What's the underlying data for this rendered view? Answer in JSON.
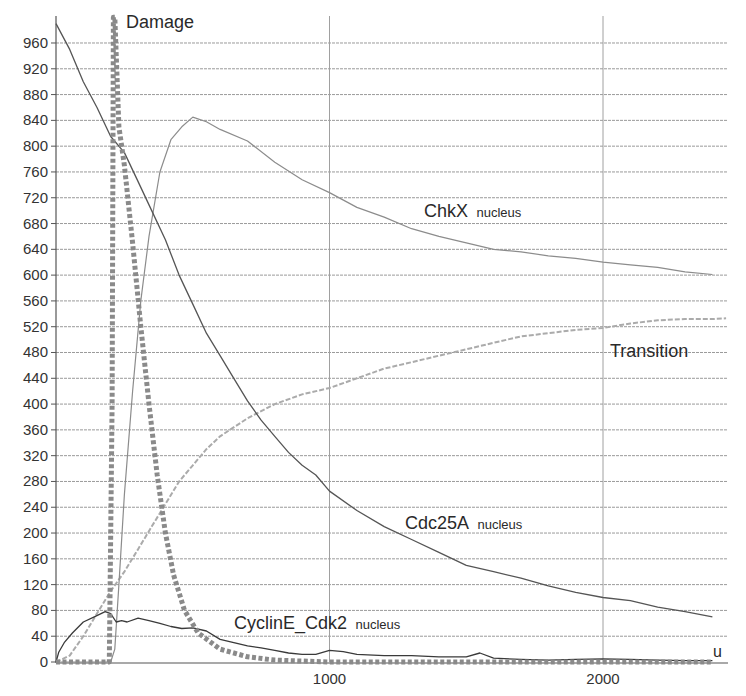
{
  "chart_data": {
    "type": "line",
    "title": "",
    "xlabel": "u",
    "ylabel": "",
    "xlim": [
      0,
      2450
    ],
    "ylim": [
      0,
      1000
    ],
    "grid": {
      "horizontal": true,
      "vertical": true
    },
    "x_ticks": [
      1000,
      2000
    ],
    "x_tick_labels": [
      "1000",
      "2000"
    ],
    "y_ticks": [
      0,
      40,
      80,
      120,
      160,
      200,
      240,
      280,
      320,
      360,
      400,
      440,
      480,
      520,
      560,
      600,
      640,
      680,
      720,
      760,
      800,
      840,
      880,
      920,
      960
    ],
    "y_tick_labels": [
      "0",
      "40",
      "80",
      "120",
      "160",
      "200",
      "240",
      "280",
      "320",
      "360",
      "400",
      "440",
      "480",
      "520",
      "560",
      "600",
      "640",
      "680",
      "720",
      "760",
      "800",
      "840",
      "880",
      "920",
      "960"
    ],
    "legend": "inline labels",
    "series": [
      {
        "name": "Damage",
        "style": "thick dotted",
        "color": "#8c8c8c",
        "x": [
          0,
          100,
          195,
          205,
          210,
          215,
          230,
          250,
          280,
          310,
          340,
          370,
          400,
          430,
          470,
          520,
          600,
          700,
          800,
          1000,
          1500,
          2000,
          2400
        ],
        "values": [
          0,
          0,
          0,
          400,
          1000,
          1000,
          830,
          770,
          650,
          520,
          400,
          290,
          200,
          135,
          80,
          45,
          20,
          8,
          3,
          0,
          0,
          0,
          0
        ]
      },
      {
        "name": "ChkX nucleus",
        "style": "thin solid",
        "color": "#8a8a8a",
        "x": [
          0,
          200,
          215,
          230,
          250,
          280,
          310,
          340,
          380,
          420,
          460,
          500,
          550,
          600,
          700,
          800,
          900,
          1000,
          1100,
          1200,
          1300,
          1400,
          1500,
          1600,
          1700,
          1800,
          1900,
          2000,
          2100,
          2200,
          2300,
          2400
        ],
        "values": [
          0,
          0,
          20,
          120,
          260,
          420,
          560,
          660,
          760,
          810,
          830,
          845,
          838,
          826,
          808,
          775,
          748,
          728,
          705,
          690,
          672,
          660,
          650,
          640,
          636,
          630,
          626,
          620,
          616,
          612,
          605,
          601
        ]
      },
      {
        "name": "Transition",
        "style": "dashed light",
        "color": "#a8a8a8",
        "x": [
          0,
          50,
          100,
          150,
          200,
          250,
          300,
          350,
          400,
          450,
          500,
          550,
          600,
          700,
          800,
          900,
          1000,
          1100,
          1200,
          1300,
          1400,
          1500,
          1600,
          1700,
          1800,
          1900,
          2000,
          2100,
          2200,
          2300,
          2400,
          2450
        ],
        "values": [
          0,
          10,
          40,
          75,
          110,
          140,
          175,
          210,
          245,
          280,
          305,
          330,
          350,
          378,
          400,
          415,
          425,
          440,
          455,
          465,
          475,
          485,
          495,
          505,
          510,
          515,
          518,
          525,
          530,
          532,
          532,
          533
        ]
      },
      {
        "name": "Cdc25A nucleus",
        "style": "solid dark",
        "color": "#555555",
        "x": [
          0,
          50,
          100,
          150,
          200,
          250,
          300,
          350,
          400,
          450,
          500,
          550,
          600,
          650,
          700,
          750,
          800,
          850,
          900,
          950,
          1000,
          1100,
          1200,
          1300,
          1400,
          1500,
          1600,
          1700,
          1800,
          1900,
          2000,
          2100,
          2200,
          2300,
          2400
        ],
        "values": [
          990,
          950,
          900,
          860,
          815,
          790,
          745,
          700,
          655,
          600,
          555,
          510,
          475,
          440,
          405,
          375,
          350,
          325,
          305,
          290,
          265,
          235,
          210,
          190,
          170,
          150,
          140,
          130,
          118,
          108,
          100,
          95,
          85,
          78,
          70
        ]
      },
      {
        "name": "CyclinE_Cdk2 nucleus",
        "style": "solid dark",
        "color": "#3a3a3a",
        "x": [
          0,
          10,
          30,
          60,
          100,
          140,
          180,
          200,
          220,
          240,
          260,
          300,
          340,
          380,
          420,
          460,
          500,
          550,
          600,
          650,
          700,
          750,
          800,
          850,
          900,
          950,
          1000,
          1050,
          1100,
          1200,
          1300,
          1400,
          1500,
          1550,
          1600,
          1700,
          1800,
          1900,
          2000,
          2100,
          2200,
          2300,
          2400
        ],
        "values": [
          0,
          15,
          30,
          45,
          62,
          70,
          78,
          75,
          62,
          64,
          62,
          68,
          64,
          60,
          55,
          52,
          53,
          48,
          35,
          30,
          25,
          22,
          18,
          14,
          12,
          12,
          18,
          16,
          12,
          10,
          10,
          8,
          8,
          14,
          6,
          4,
          3,
          4,
          5,
          4,
          3,
          2,
          2
        ]
      }
    ],
    "annotations": [
      {
        "text": "Damage",
        "x": 330,
        "y": 1030
      },
      {
        "text": "ChkX",
        "sub": "nucleus",
        "x": 1350,
        "y": 690
      },
      {
        "text": "Transition",
        "x": 2290,
        "y": 470
      },
      {
        "text": "Cdc25A",
        "sub": "nucleus",
        "x": 1420,
        "y": 215
      },
      {
        "text": "CyclinE_Cdk2",
        "sub": "nucleus",
        "x": 660,
        "y": 45
      }
    ]
  },
  "labels": {
    "damage": "Damage",
    "chkx": "ChkX",
    "chkx_sub": "nucleus",
    "transition": "Transition",
    "cdc25a": "Cdc25A",
    "cdc25a_sub": "nucleus",
    "cycline": "CyclinE_Cdk2",
    "cycline_sub": "nucleus",
    "x_unit": "u"
  }
}
